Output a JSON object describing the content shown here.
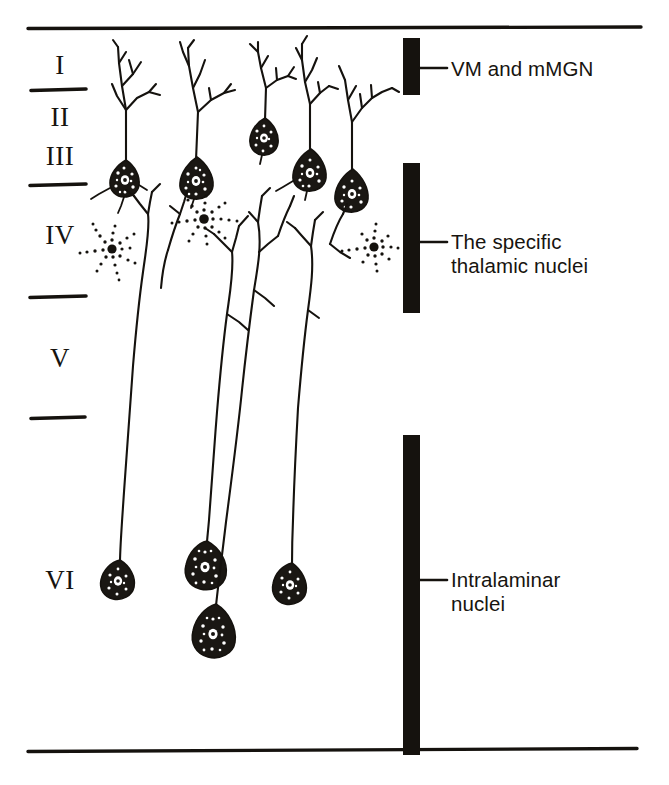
{
  "figure": {
    "background_color": "#ffffff",
    "ink_color": "#15120e",
    "width": 669,
    "height": 785
  },
  "cortical_layers": {
    "description": "Roman-numeral labels for cerebral cortex laminae, top to bottom",
    "items": [
      {
        "label": "I",
        "name": "layer-i",
        "x": 30,
        "y": 52
      },
      {
        "label": "II",
        "name": "layer-ii",
        "x": 30,
        "y": 104
      },
      {
        "label": "III",
        "name": "layer-iii",
        "x": 30,
        "y": 143
      },
      {
        "label": "IV",
        "name": "layer-iv",
        "x": 30,
        "y": 222
      },
      {
        "label": "V",
        "name": "layer-v",
        "x": 30,
        "y": 345
      },
      {
        "label": "VI",
        "name": "layer-vi",
        "x": 30,
        "y": 567
      }
    ]
  },
  "layer_dividers": {
    "description": "Short horizontal rules separating laminae in the left margin",
    "y_positions": [
      90,
      185,
      297,
      418
    ],
    "x_start": 30,
    "x_end": 86
  },
  "frame": {
    "top_rule": {
      "y": 28,
      "x_start": 28,
      "x_end": 641
    },
    "bottom_rule": {
      "y": 750,
      "x_start": 28,
      "x_end": 637
    }
  },
  "afferent_bars": {
    "description": "Solid black vertical bars showing the cortical depth of termination of each thalamic afferent system",
    "items": [
      {
        "name": "vm-mmgn-bar",
        "label": "VM and mMGN",
        "bar": {
          "x": 403,
          "y_top": 38,
          "y_bottom": 95,
          "width": 17
        },
        "leader": {
          "y": 68,
          "x_start": 420,
          "x_end": 447
        },
        "text_x": 451,
        "text_y": 57
      },
      {
        "name": "specific-thalamic-nuclei-bar",
        "label": "The specific\nthalamic nuclei",
        "bar": {
          "x": 403,
          "y_top": 163,
          "y_bottom": 313,
          "width": 17
        },
        "leader": {
          "y": 242,
          "x_start": 420,
          "x_end": 447
        },
        "text_x": 451,
        "text_y": 230
      },
      {
        "name": "intralaminar-nuclei-bar",
        "label": "Intralaminar\nnuclei",
        "bar": {
          "x": 403,
          "y_top": 435,
          "y_bottom": 755,
          "width": 17
        },
        "leader": {
          "y": 580,
          "x_start": 420,
          "x_end": 447
        },
        "text_x": 451,
        "text_y": 568
      }
    ]
  },
  "neurons": {
    "supragranular_pyramidal_count": 5,
    "layer_iv_stellate_count": 3,
    "layer_vi_pyramidal_count": 4,
    "descending_apical_trunk_count": 4,
    "description": "Camera-lucida style drawing: five pyramidal cells in layers II-III with apical dendrites arborizing in layer I; three stippled stellate interneurons in layer IV; four deep layer VI pyramidal neurons with long apical dendrites ascending to layer IV"
  }
}
